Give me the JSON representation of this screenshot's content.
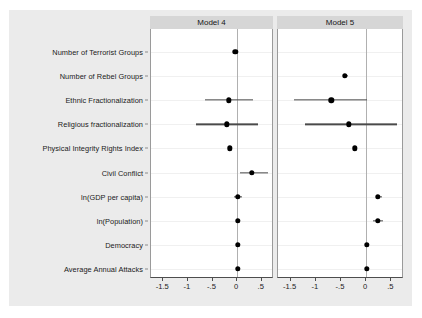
{
  "figure": {
    "background": "#ebebeb",
    "plot_background": "#ffffff",
    "panel_header_color": "#d6d6d6",
    "marker_color": "#000000",
    "ci_color": "#4a4a4a"
  },
  "chart_data": {
    "type": "scatter",
    "title": "",
    "xlabel": "",
    "ylabel": "",
    "subplot_layout": "1x2",
    "grid": true,
    "legend": "none",
    "zero_reference_line": true,
    "xlim": [
      -1.75,
      0.75
    ],
    "xticks": [
      -1.5,
      -1,
      -0.5,
      0,
      0.5
    ],
    "xticklabels": [
      "-1.5",
      "-1",
      "-.5",
      "0",
      ".5"
    ],
    "categories": [
      "Number of Terrorist Groups",
      "Number of Rebel Groups",
      "Ethnic Fractionalization",
      "Religious fractionalization",
      "Physical Integrity Rights Index",
      "Civil Conflict",
      "ln(GDP per capita)",
      "ln(Population)",
      "Democracy",
      "Average Annual Attacks"
    ],
    "panels": [
      {
        "name": "Model 4",
        "points": [
          {
            "category": "Number of Terrorist Groups",
            "estimate": -0.04,
            "ci_low": -0.06,
            "ci_high": -0.02
          },
          {
            "category": "Number of Rebel Groups",
            "estimate": null,
            "ci_low": null,
            "ci_high": null
          },
          {
            "category": "Ethnic Fractionalization",
            "estimate": -0.17,
            "ci_low": -0.65,
            "ci_high": 0.33
          },
          {
            "category": "Religious fractionalization",
            "estimate": -0.21,
            "ci_low": -0.84,
            "ci_high": 0.42
          },
          {
            "category": "Physical Integrity Rights Index",
            "estimate": -0.15,
            "ci_low": -0.18,
            "ci_high": -0.12
          },
          {
            "category": "Civil Conflict",
            "estimate": 0.3,
            "ci_low": 0.06,
            "ci_high": 0.63
          },
          {
            "category": "ln(GDP per capita)",
            "estimate": 0.01,
            "ci_low": -0.07,
            "ci_high": 0.09
          },
          {
            "category": "ln(Population)",
            "estimate": 0.02,
            "ci_low": -0.02,
            "ci_high": 0.06
          },
          {
            "category": "Democracy",
            "estimate": 0.01,
            "ci_low": 0.0,
            "ci_high": 0.02
          },
          {
            "category": "Average Annual Attacks",
            "estimate": 0.01,
            "ci_low": 0.0,
            "ci_high": 0.02
          }
        ]
      },
      {
        "name": "Model 5",
        "points": [
          {
            "category": "Number of Terrorist Groups",
            "estimate": null,
            "ci_low": null,
            "ci_high": null
          },
          {
            "category": "Number of Rebel Groups",
            "estimate": -0.42,
            "ci_low": -0.47,
            "ci_high": -0.36
          },
          {
            "category": "Ethnic Fractionalization",
            "estimate": -0.69,
            "ci_low": -1.43,
            "ci_high": 0.01
          },
          {
            "category": "Religious fractionalization",
            "estimate": -0.34,
            "ci_low": -1.22,
            "ci_high": 0.61
          },
          {
            "category": "Physical Integrity Rights Index",
            "estimate": -0.23,
            "ci_low": -0.27,
            "ci_high": -0.2
          },
          {
            "category": "Civil Conflict",
            "estimate": null,
            "ci_low": null,
            "ci_high": null
          },
          {
            "category": "ln(GDP per capita)",
            "estimate": 0.23,
            "ci_low": 0.19,
            "ci_high": 0.32
          },
          {
            "category": "ln(Population)",
            "estimate": 0.23,
            "ci_low": 0.13,
            "ci_high": 0.33
          },
          {
            "category": "Democracy",
            "estimate": 0.01,
            "ci_low": 0.0,
            "ci_high": 0.02
          },
          {
            "category": "Average Annual Attacks",
            "estimate": 0.01,
            "ci_low": 0.0,
            "ci_high": 0.02
          }
        ]
      }
    ]
  }
}
